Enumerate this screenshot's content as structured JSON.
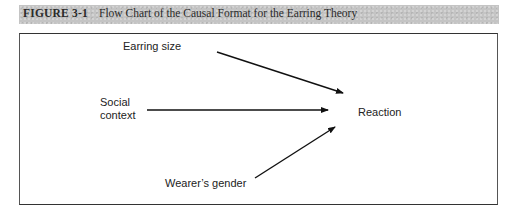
{
  "figure": {
    "label": "FIGURE 3-1",
    "title": "Flow Chart of the Causal Format for the Earring Theory"
  },
  "diagram": {
    "nodes": {
      "earring_size": "Earring size",
      "social_context_line1": "Social",
      "social_context_line2": "context",
      "reaction": "Reaction",
      "wearers_gender": "Wearer’s gender"
    },
    "edges": [
      {
        "from": "Earring size",
        "to": "Reaction"
      },
      {
        "from": "Social context",
        "to": "Reaction"
      },
      {
        "from": "Wearer’s gender",
        "to": "Reaction"
      }
    ],
    "colors": {
      "header_bg": "#c4c4c4",
      "line": "#111111",
      "frame": "#555555"
    }
  }
}
